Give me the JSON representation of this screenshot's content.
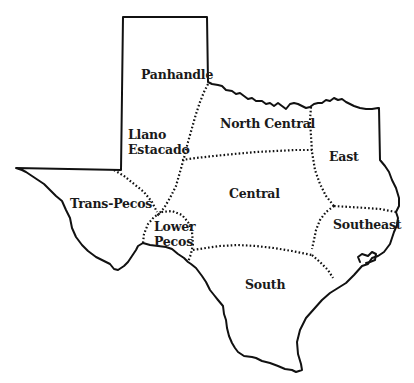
{
  "map": {
    "type": "regional map",
    "subject": "Texas",
    "colors": {
      "line": "#111111",
      "background": "#ffffff",
      "text": "#1a1a1a"
    },
    "regions": [
      {
        "name": "Panhandle",
        "label": "Panhandle",
        "x": 141,
        "y": 74
      },
      {
        "name": "Llano Estacado",
        "label": "Llano\nEstacado",
        "x": 128,
        "y": 128
      },
      {
        "name": "North Central",
        "label": "North Central",
        "x": 220,
        "y": 116
      },
      {
        "name": "East",
        "label": "East",
        "x": 329,
        "y": 150
      },
      {
        "name": "Trans-Pecos",
        "label": "Trans-Pecos",
        "x": 70,
        "y": 197
      },
      {
        "name": "Central",
        "label": "Central",
        "x": 229,
        "y": 188
      },
      {
        "name": "Lower Pecos",
        "label": "Lower\nPecos",
        "x": 154,
        "y": 220
      },
      {
        "name": "Southeast",
        "label": "Southeast",
        "x": 333,
        "y": 218
      },
      {
        "name": "South",
        "label": "South",
        "x": 245,
        "y": 278
      }
    ]
  }
}
